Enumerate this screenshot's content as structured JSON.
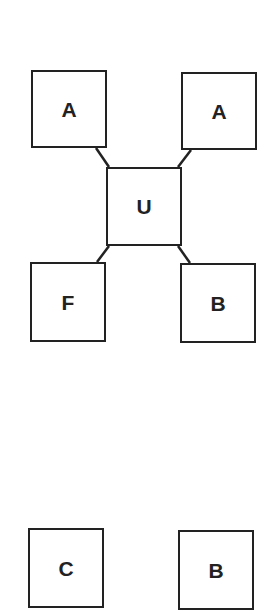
{
  "diagram": {
    "colors": {
      "stroke": "#222222",
      "fill": "#ffffff",
      "text": "#222222"
    },
    "nodes": [
      {
        "id": "a-left",
        "label": "A"
      },
      {
        "id": "a-right",
        "label": "A"
      },
      {
        "id": "u",
        "label": "U"
      },
      {
        "id": "f",
        "label": "F"
      },
      {
        "id": "b-upper",
        "label": "B"
      },
      {
        "id": "c",
        "label": "C"
      },
      {
        "id": "b-lower",
        "label": "B"
      }
    ],
    "edges": [
      {
        "from": "a-left",
        "to": "u"
      },
      {
        "from": "a-right",
        "to": "u"
      },
      {
        "from": "u",
        "to": "f"
      },
      {
        "from": "u",
        "to": "b-upper"
      }
    ]
  }
}
